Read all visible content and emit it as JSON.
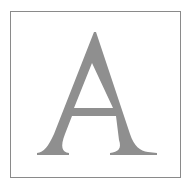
{
  "image": {
    "letter": "A",
    "description": "Grey serif capital letter A inside a thin square frame",
    "colors": {
      "letter": "#8f8f8f",
      "frame": "#8a8a8a",
      "background": "#ffffff"
    }
  }
}
